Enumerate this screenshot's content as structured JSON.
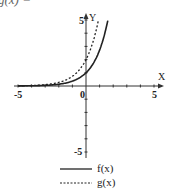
{
  "header": {
    "cropped_label": "g(x) ="
  },
  "chart_data": {
    "type": "line",
    "title": "",
    "xlabel": "X",
    "ylabel": "Y",
    "xlim": [
      -5,
      5
    ],
    "ylim": [
      -5,
      5
    ],
    "x_ticks": [
      "-5",
      "0",
      "5"
    ],
    "y_ticks": [
      "5",
      "-5"
    ],
    "grid": false,
    "legend_position": "bottom",
    "series": [
      {
        "name": "f(x)",
        "style": "solid",
        "expr": "e^x",
        "x": [
          -5,
          -4,
          -3,
          -2,
          -1,
          0,
          1,
          1.6
        ],
        "y": [
          0.007,
          0.018,
          0.05,
          0.135,
          0.37,
          1,
          2.72,
          4.95
        ]
      },
      {
        "name": "g(x)",
        "style": "dashed",
        "expr": "2e^x",
        "x": [
          -5,
          -4,
          -3,
          -2,
          -1,
          0,
          0.5,
          0.9
        ],
        "y": [
          0.013,
          0.037,
          0.1,
          0.27,
          0.74,
          2,
          3.3,
          4.9
        ]
      }
    ]
  },
  "legend": {
    "f": "f(x)",
    "g": "g(x)"
  }
}
